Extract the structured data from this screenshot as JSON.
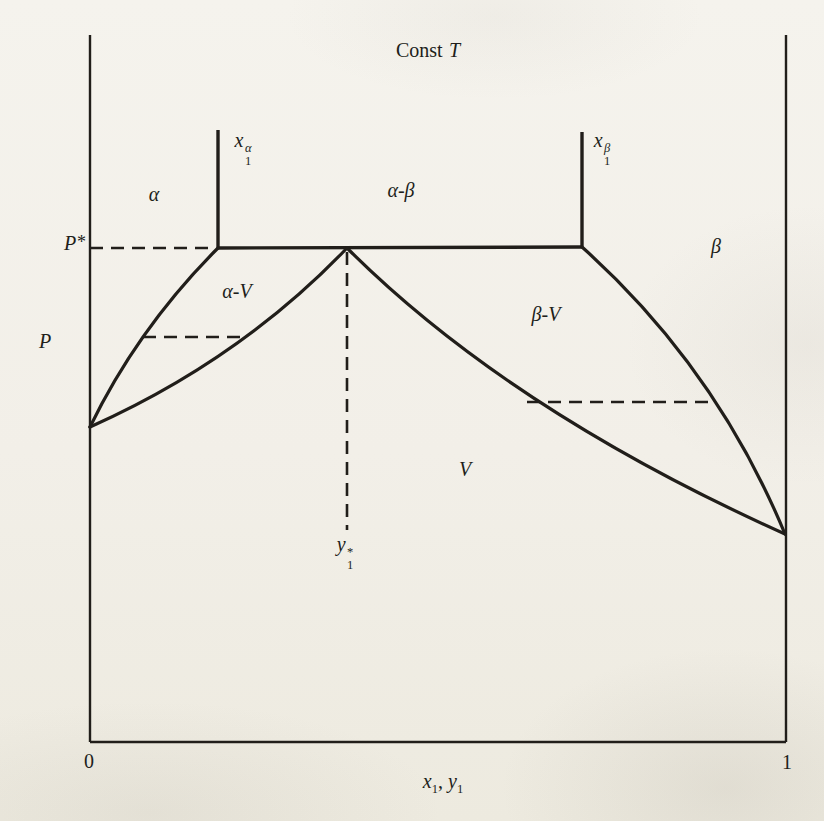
{
  "figure": {
    "title": {
      "text": "Const",
      "symbol": "T"
    },
    "y_axis_label": "P",
    "x_axis_label": {
      "base1": "x",
      "sub1": "1",
      "sep": ",",
      "base2": "y",
      "sub2": "1"
    },
    "x_min": "0",
    "x_max": "1"
  },
  "annotations": {
    "p_star": {
      "base": "P",
      "sup": "*"
    },
    "x1_alpha": {
      "base": "x",
      "sub": "1",
      "sup": "α"
    },
    "x1_beta": {
      "base": "x",
      "sub": "1",
      "sup": "β"
    },
    "y1_star": {
      "base": "y",
      "sub": "1",
      "sup": "*"
    }
  },
  "regions": {
    "alpha": "α",
    "alpha_beta": "α-β",
    "beta": "β",
    "alpha_v": "α-V",
    "beta_v": "β-V",
    "v": "V"
  },
  "colors": {
    "ink": "#211e1a",
    "paper": "#f2efe8"
  },
  "chart_data": {
    "type": "line",
    "xlabel": "x1, y1",
    "ylabel": "P",
    "xlim": [
      0,
      1
    ],
    "note": "Schematic P-x-y phase diagram at constant T; P axis unlabeled, values given as fraction of axis height",
    "key_values": {
      "P_star": 0.7,
      "x1_alpha": 0.18,
      "x1_beta": 0.71,
      "y1_star": 0.37,
      "P_sat_at_x0": 0.45,
      "P_sat_at_x1": 0.29
    },
    "series": [
      {
        "name": "alpha bubble curve",
        "points": [
          [
            0,
            0.45
          ],
          [
            0.076,
            0.57
          ],
          [
            0.18,
            0.7
          ]
        ]
      },
      {
        "name": "dew curve",
        "points": [
          [
            0,
            0.45
          ],
          [
            0.227,
            0.57
          ],
          [
            0.37,
            0.7
          ],
          [
            0.62,
            0.48
          ],
          [
            1,
            0.29
          ]
        ]
      },
      {
        "name": "beta bubble curve",
        "points": [
          [
            0.71,
            0.7
          ],
          [
            0.9,
            0.48
          ],
          [
            1,
            0.29
          ]
        ]
      },
      {
        "name": "three-phase line",
        "points": [
          [
            0.18,
            0.7
          ],
          [
            0.71,
            0.7
          ]
        ]
      }
    ],
    "regions": [
      "α",
      "α-β",
      "β",
      "α-V",
      "β-V",
      "V"
    ],
    "grid": false,
    "legend": false
  },
  "geometry": {
    "frame": {
      "left": 90,
      "right": 786,
      "bottom": 742,
      "top": 35
    },
    "solid_lines": [
      {
        "name": "x1-alpha-composition-line",
        "x1": 218,
        "y1": 130,
        "x2": 218,
        "y2": 249
      },
      {
        "name": "x1-beta-composition-line",
        "x1": 582,
        "y1": 132,
        "x2": 582,
        "y2": 248
      },
      {
        "name": "three-phase-line",
        "x1": 218,
        "y1": 248,
        "x2": 582,
        "y2": 247
      }
    ],
    "curves": [
      {
        "name": "alpha-bubble-curve",
        "path": "M 90 427 Q 138 328 218 248"
      },
      {
        "name": "alpha-dew-curve",
        "path": "M 90 427 Q 240 360 347 248"
      },
      {
        "name": "beta-dew-curve",
        "path": "M 347 248 Q 509 410 785 534"
      },
      {
        "name": "beta-bubble-curve",
        "path": "M 582 247 Q 716 367 785 534"
      }
    ],
    "dashed_lines": [
      {
        "name": "p-star-dashed-line",
        "x1": 90,
        "y1": 248,
        "x2": 216,
        "y2": 248
      },
      {
        "name": "alpha-v-tie-line",
        "x1": 143,
        "y1": 337,
        "x2": 248,
        "y2": 337
      },
      {
        "name": "beta-v-tie-line",
        "x1": 527,
        "y1": 402,
        "x2": 716,
        "y2": 402
      },
      {
        "name": "y1-star-dashed-line",
        "x1": 347,
        "y1": 252,
        "x2": 347,
        "y2": 530
      }
    ]
  }
}
